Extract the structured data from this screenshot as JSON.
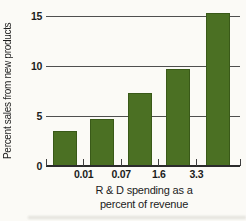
{
  "chart_data": {
    "type": "bar",
    "title": "",
    "ylabel": "Percent sales from new products",
    "xlabel": "R & D spending as a percent of revenue",
    "xlabel_lines": [
      "R & D spending as a",
      "percent of revenue"
    ],
    "x_boundary_labels": [
      "0.01",
      "0.07",
      "1.6",
      "3.3"
    ],
    "categories": [
      "below 0.01",
      "0.01 to 0.07",
      "0.07 to 1.6",
      "1.6 to 3.3",
      "above 3.3"
    ],
    "values": [
      3.5,
      4.7,
      7.3,
      9.7,
      15.3
    ],
    "y_ticks": [
      0,
      5,
      10,
      15
    ],
    "ylim": [
      0,
      15.5
    ],
    "grid": "horizontal",
    "x_ticks_between_bars": true,
    "legend_position": "none",
    "bar_color": "#4b7023",
    "gridline_color": "#4f4f4f",
    "axis_color": "#2b2b2b",
    "text_color": "#1c1c1c",
    "background_color": "#fbfaf6"
  }
}
